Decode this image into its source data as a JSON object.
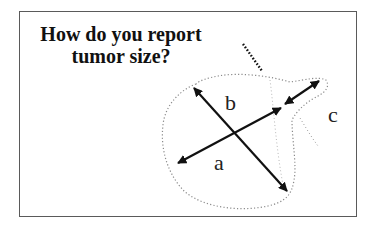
{
  "slide": {
    "title_lines": [
      "How do you report",
      "tumor size?"
    ]
  },
  "diagram": {
    "labels": {
      "a": "a",
      "b": "b",
      "c": "c"
    },
    "colors": {
      "arrow": "#111111",
      "outline": "#777777",
      "frame": "#5a5a5a"
    }
  }
}
